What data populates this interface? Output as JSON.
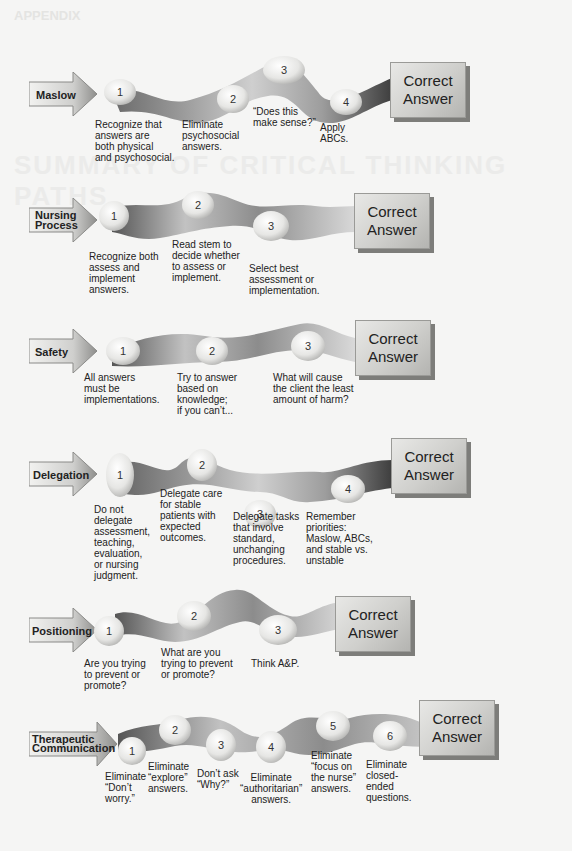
{
  "page": {
    "ghost_header": "APPENDIX",
    "ghost_title": "SUMMARY OF CRITICAL THINKING PATHS"
  },
  "answer_label": {
    "line1": "Correct",
    "line2": "Answer"
  },
  "colors": {
    "ribbon_dark": "#5a5a5a",
    "ribbon_light": "#c8c8c8",
    "pebble": "#e9e9e7",
    "answer_box": "#cfcfcc"
  },
  "paths": [
    {
      "label": "Maslow",
      "steps": [
        {
          "n": "1",
          "text": "Recognize that\nanswers are\nboth physical\nand psychosocial."
        },
        {
          "n": "2",
          "text": "Eliminate\npsychosocial\nanswers."
        },
        {
          "n": "3",
          "text": "“Does this\nmake sense?”"
        },
        {
          "n": "4",
          "text": "Apply\nABCs."
        }
      ]
    },
    {
      "label_line1": "Nursing",
      "label_line2": "Process",
      "steps": [
        {
          "n": "1",
          "text": "Recognize both\nassess and\nimplement\nanswers."
        },
        {
          "n": "2",
          "text": "Read stem to\ndecide whether\nto assess or\nimplement."
        },
        {
          "n": "3",
          "text": "Select best\nassessment or\nimplementation."
        }
      ]
    },
    {
      "label": "Safety",
      "steps": [
        {
          "n": "1",
          "text": "All answers\nmust be\nimplementations."
        },
        {
          "n": "2",
          "text": "Try to answer\nbased on\nknowledge;\nif you can’t..."
        },
        {
          "n": "3",
          "text": "What will cause\nthe client the least\namount of harm?"
        }
      ]
    },
    {
      "label": "Delegation",
      "steps": [
        {
          "n": "1",
          "text": "Do not\ndelegate\nassessment,\nteaching,\nevaluation,\nor nursing\njudgment."
        },
        {
          "n": "2",
          "text": "Delegate care\nfor stable\npatients with\nexpected\noutcomes."
        },
        {
          "n": "3",
          "text": "Delegate tasks\nthat involve\nstandard,\nunchanging\nprocedures."
        },
        {
          "n": "4",
          "text": "Remember\npriorities:\nMaslow, ABCs,\nand stable vs.\nunstable"
        }
      ]
    },
    {
      "label": "Positioning",
      "steps": [
        {
          "n": "1",
          "text": "Are you trying\nto prevent or\npromote?"
        },
        {
          "n": "2",
          "text": "What are you\ntrying to prevent\nor promote?"
        },
        {
          "n": "3",
          "text": "Think A&P."
        }
      ]
    },
    {
      "label_line1": "Therapeutic",
      "label_line2": "Communication",
      "steps": [
        {
          "n": "1",
          "text": "Eliminate\n“Don’t\nworry.”"
        },
        {
          "n": "2",
          "text": "Eliminate\n“explore”\nanswers."
        },
        {
          "n": "3",
          "text": "Don’t ask\n“Why?”"
        },
        {
          "n": "4",
          "text": "Eliminate\n“authoritarian”\nanswers."
        },
        {
          "n": "5",
          "text": "Eliminate\n“focus on\nthe nurse”\nanswers."
        },
        {
          "n": "6",
          "text": "Eliminate\nclosed-\nended\nquestions."
        }
      ]
    }
  ]
}
